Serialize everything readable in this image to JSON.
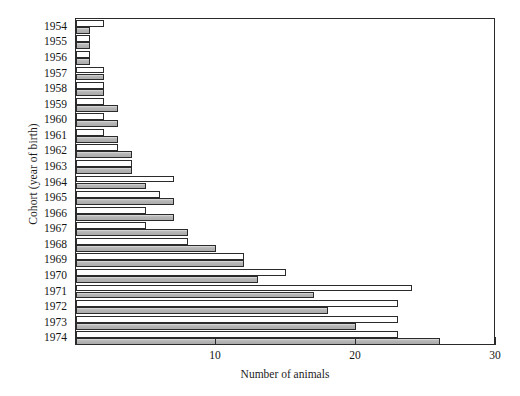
{
  "chart_data": {
    "type": "bar",
    "orientation": "horizontal",
    "title": "",
    "xlabel": "Number of animals",
    "ylabel": "Cohort (year of birth)",
    "xlim": [
      0,
      30
    ],
    "ylim_categories_top_to_bottom": true,
    "grid": false,
    "legend": "none",
    "xticks": [
      10,
      20,
      30
    ],
    "xtick_labels": [
      "10",
      "20",
      "30"
    ],
    "categories": [
      "1954",
      "1955",
      "1956",
      "1957",
      "1958",
      "1959",
      "1960",
      "1961",
      "1962",
      "1963",
      "1964",
      "1965",
      "1966",
      "1967",
      "1968",
      "1969",
      "1970",
      "1971",
      "1972",
      "1973",
      "1974"
    ],
    "series": [
      {
        "name": "open",
        "style": "unfilled",
        "color": "#ffffff",
        "values": [
          2,
          1,
          1,
          2,
          2,
          2,
          2,
          2,
          3,
          4,
          7,
          6,
          5,
          5,
          8,
          12,
          15,
          24,
          23,
          23,
          23
        ]
      },
      {
        "name": "filled",
        "style": "gray",
        "color": "#b6b6b6",
        "values": [
          1,
          1,
          1,
          2,
          2,
          3,
          3,
          3,
          4,
          4,
          5,
          7,
          7,
          8,
          10,
          12,
          13,
          17,
          18,
          20,
          26
        ]
      }
    ]
  },
  "axes": {
    "x_title": "Number of animals",
    "y_title": "Cohort (year of birth)"
  }
}
